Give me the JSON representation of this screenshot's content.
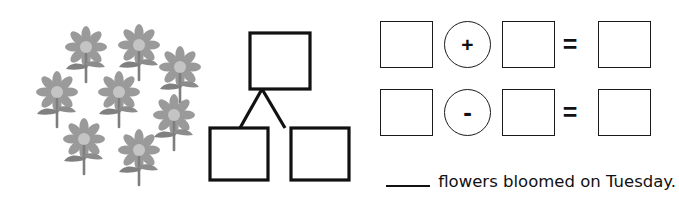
{
  "worksheet": {
    "flowers": {
      "icon": "flower-icon",
      "count": 7,
      "color": "#9a9a9a",
      "center_color": "#c9c9c9",
      "stem_color": "#7e7e7e",
      "positions": [
        {
          "left": 57,
          "top": 25
        },
        {
          "left": 110,
          "top": 23
        },
        {
          "left": 151,
          "top": 45
        },
        {
          "left": 28,
          "top": 70
        },
        {
          "left": 90,
          "top": 70
        },
        {
          "left": 145,
          "top": 93
        },
        {
          "left": 55,
          "top": 117
        },
        {
          "left": 110,
          "top": 128
        }
      ]
    },
    "number_bond": {
      "name": "number-bond-diagram",
      "stroke_color": "#111111",
      "total_box": {
        "label": ""
      },
      "part_boxes": [
        {
          "label": ""
        },
        {
          "label": ""
        }
      ]
    },
    "equations": {
      "stroke_color": "#1a1a1a",
      "equals_symbol": "=",
      "rows": [
        {
          "name": "addition-equation",
          "operator": "+",
          "operator_icon": "plus-icon",
          "boxes": [
            "",
            "",
            ""
          ]
        },
        {
          "name": "subtraction-equation",
          "operator": "-",
          "operator_icon": "minus-icon",
          "boxes": [
            "",
            "",
            ""
          ]
        }
      ]
    },
    "sentence": {
      "blank": "______",
      "text": "flowers bloomed on Tuesday."
    }
  }
}
